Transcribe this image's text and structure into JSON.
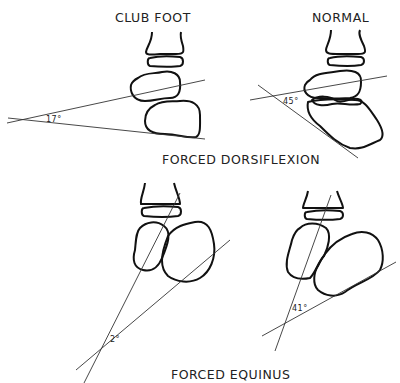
{
  "panels": {
    "club_foot_dorsiflexion": {
      "heading": "CLUB FOOT",
      "angle": "17°"
    },
    "normal_dorsiflexion": {
      "heading": "NORMAL",
      "angle": "45°"
    },
    "club_foot_equinus": {
      "angle": "2°"
    },
    "normal_equinus": {
      "angle": "41°"
    }
  },
  "captions": {
    "dorsiflexion": "FORCED  DORSIFLEXION",
    "equinus": "FORCED  EQUINUS"
  },
  "colors": {
    "line": "#111111",
    "background": "#ffffff"
  }
}
